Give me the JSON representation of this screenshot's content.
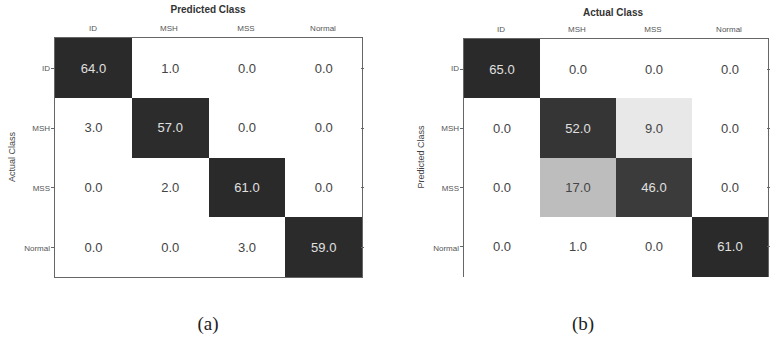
{
  "chart_data": [
    {
      "type": "heatmap",
      "subtype": "confusion_matrix",
      "caption": "(a)",
      "title": "Predicted Class",
      "xlabel": "Predicted Class",
      "ylabel": "Actual Class",
      "x_categories": [
        "ID",
        "MSH",
        "MSS",
        "Normal"
      ],
      "y_categories": [
        "ID",
        "MSH",
        "MSS",
        "Normal"
      ],
      "values": [
        [
          "64.0",
          "1.0",
          "0.0",
          "0.0"
        ],
        [
          "3.0",
          "57.0",
          "0.0",
          "0.0"
        ],
        [
          "0.0",
          "2.0",
          "61.0",
          "0.0"
        ],
        [
          "0.0",
          "0.0",
          "3.0",
          "59.0"
        ]
      ],
      "colors": [
        [
          "#2a2a2a",
          "#ffffff",
          "#ffffff",
          "#ffffff"
        ],
        [
          "#ffffff",
          "#2c2c2c",
          "#ffffff",
          "#ffffff"
        ],
        [
          "#ffffff",
          "#ffffff",
          "#2a2a2a",
          "#ffffff"
        ],
        [
          "#ffffff",
          "#ffffff",
          "#ffffff",
          "#2b2b2b"
        ]
      ],
      "text_colors": [
        [
          "#e0e0e0",
          "#444444",
          "#444444",
          "#444444"
        ],
        [
          "#444444",
          "#e0e0e0",
          "#444444",
          "#444444"
        ],
        [
          "#444444",
          "#444444",
          "#e0e0e0",
          "#444444"
        ],
        [
          "#444444",
          "#444444",
          "#444444",
          "#e0e0e0"
        ]
      ]
    },
    {
      "type": "heatmap",
      "subtype": "confusion_matrix",
      "caption": "(b)",
      "title": "Actual Class",
      "xlabel": "Actual Class",
      "ylabel": "Predicted Class",
      "x_categories": [
        "ID",
        "MSH",
        "MSS",
        "Normal"
      ],
      "y_categories": [
        "ID",
        "MSH",
        "MSS",
        "Normal"
      ],
      "values": [
        [
          "65.0",
          "0.0",
          "0.0",
          "0.0"
        ],
        [
          "0.0",
          "52.0",
          "9.0",
          "0.0"
        ],
        [
          "0.0",
          "17.0",
          "46.0",
          "0.0"
        ],
        [
          "0.0",
          "1.0",
          "0.0",
          "61.0"
        ]
      ],
      "colors": [
        [
          "#2a2a2a",
          "#ffffff",
          "#ffffff",
          "#ffffff"
        ],
        [
          "#ffffff",
          "#353535",
          "#e8e8e8",
          "#ffffff"
        ],
        [
          "#ffffff",
          "#bdbdbd",
          "#3b3b3b",
          "#ffffff"
        ],
        [
          "#ffffff",
          "#ffffff",
          "#ffffff",
          "#2a2a2a"
        ]
      ],
      "text_colors": [
        [
          "#e0e0e0",
          "#444444",
          "#444444",
          "#444444"
        ],
        [
          "#444444",
          "#e0e0e0",
          "#444444",
          "#444444"
        ],
        [
          "#444444",
          "#444444",
          "#e0e0e0",
          "#444444"
        ],
        [
          "#444444",
          "#444444",
          "#444444",
          "#e0e0e0"
        ]
      ]
    }
  ]
}
